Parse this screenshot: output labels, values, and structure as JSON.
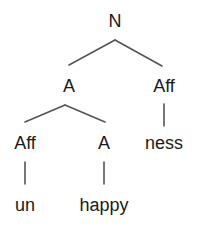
{
  "tree": {
    "root": {
      "label": "N"
    },
    "level1": [
      {
        "label": "A"
      },
      {
        "label": "Aff"
      }
    ],
    "level2": [
      {
        "label": "Aff"
      },
      {
        "label": "A"
      },
      {
        "label": "ness"
      }
    ],
    "leaves": [
      {
        "label": "un"
      },
      {
        "label": "happy"
      }
    ]
  },
  "colors": {
    "line": "#555555",
    "text": "#1a1a1a",
    "background": "#ffffff"
  }
}
